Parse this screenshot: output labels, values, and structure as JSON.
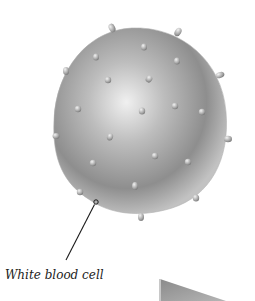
{
  "diagram": {
    "label": "White blood cell",
    "colors": {
      "cell_light": "#e6e6e6",
      "cell_mid": "#a8a8a8",
      "cell_dark": "#6e6e6e",
      "bump": "#b9b9b9",
      "line": "#1a1a1a",
      "shape_gray": "#9a9a9a"
    }
  }
}
